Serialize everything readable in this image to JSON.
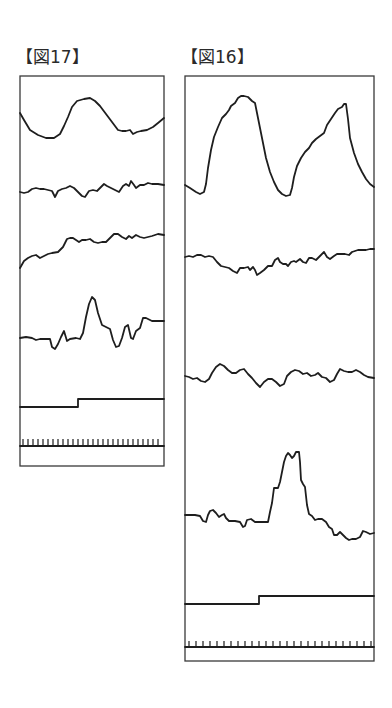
{
  "figures": [
    {
      "id": "fig17",
      "label": "【図17】",
      "traces": [
        {
          "name": "waveform-1",
          "description": "single broad peak"
        },
        {
          "name": "waveform-2",
          "description": "noisy flat signal"
        },
        {
          "name": "waveform-3",
          "description": "rising noisy signal"
        },
        {
          "name": "waveform-4",
          "description": "baseline with single spike"
        },
        {
          "name": "step-signal",
          "description": "step up at ~40% of width"
        },
        {
          "name": "timing-ticks",
          "description": "clock tick marks",
          "tick_count": 28
        }
      ]
    },
    {
      "id": "fig16",
      "label": "【図16】",
      "traces": [
        {
          "name": "waveform-1",
          "description": "two large peaks"
        },
        {
          "name": "waveform-2",
          "description": "noisy signal with slight dip then rise"
        },
        {
          "name": "waveform-3",
          "description": "noisy flat signal"
        },
        {
          "name": "waveform-4",
          "description": "baseline with tall plateau pulse"
        },
        {
          "name": "step-signal",
          "description": "step up at ~40% of width"
        },
        {
          "name": "timing-ticks",
          "description": "clock tick marks",
          "tick_count": 27
        }
      ]
    }
  ],
  "colors": {
    "line": "#1e1e1e",
    "frame": "#3a3a3a",
    "background": "#ffffff"
  }
}
